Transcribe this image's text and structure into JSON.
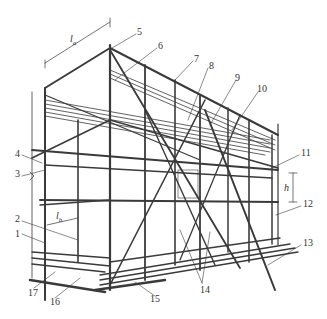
{
  "diagram": {
    "dimensions": {
      "bay_length": "l",
      "bay_length_sub": "a",
      "bay_width": "l",
      "bay_width_sub": "b",
      "lift_height": "h"
    },
    "callouts": [
      {
        "id": "1",
        "x": 15,
        "y": 232
      },
      {
        "id": "2",
        "x": 15,
        "y": 217
      },
      {
        "id": "3",
        "x": 15,
        "y": 172
      },
      {
        "id": "4",
        "x": 15,
        "y": 152
      },
      {
        "id": "5",
        "x": 137,
        "y": 30
      },
      {
        "id": "6",
        "x": 158,
        "y": 44
      },
      {
        "id": "7",
        "x": 194,
        "y": 57
      },
      {
        "id": "8",
        "x": 209,
        "y": 64
      },
      {
        "id": "9",
        "x": 235,
        "y": 76
      },
      {
        "id": "10",
        "x": 257,
        "y": 87
      },
      {
        "id": "11",
        "x": 301,
        "y": 151
      },
      {
        "id": "12",
        "x": 303,
        "y": 202
      },
      {
        "id": "13",
        "x": 303,
        "y": 241
      },
      {
        "id": "14",
        "x": 200,
        "y": 288
      },
      {
        "id": "15",
        "x": 150,
        "y": 297
      },
      {
        "id": "16",
        "x": 50,
        "y": 300
      },
      {
        "id": "17",
        "x": 28,
        "y": 291
      }
    ],
    "colors": {
      "line": "#3a3a3a",
      "background": "#ffffff"
    }
  }
}
